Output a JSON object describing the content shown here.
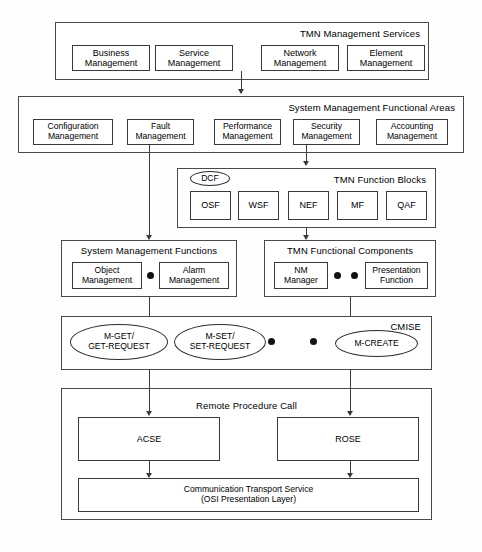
{
  "diagram": {
    "layers": [
      {
        "id": "tmn-management-services",
        "title": "TMN Management Services",
        "items": [
          {
            "label": "Business\nManagement"
          },
          {
            "label": "Service\nManagement"
          },
          {
            "label": "Network\nManagement"
          },
          {
            "label": "Element\nManagement"
          }
        ]
      },
      {
        "id": "system-management-functional-areas",
        "title": "System Management Functional Areas",
        "items": [
          {
            "label": "Configuration\nManagement"
          },
          {
            "label": "Fault\nManagement"
          },
          {
            "label": "Performance\nManagement"
          },
          {
            "label": "Security\nManagement"
          },
          {
            "label": "Accounting\nManagement"
          }
        ]
      },
      {
        "id": "tmn-function-blocks",
        "title": "TMN Function Blocks",
        "badge": "DCF",
        "items": [
          {
            "label": "OSF"
          },
          {
            "label": "WSF"
          },
          {
            "label": "NEF"
          },
          {
            "label": "MF"
          },
          {
            "label": "QAF"
          }
        ]
      },
      {
        "id": "system-management-functions",
        "title": "System Management Functions",
        "items": [
          {
            "label": "Object\nManagement"
          },
          {
            "label": "Alarm\nManagement"
          }
        ]
      },
      {
        "id": "tmn-functional-components",
        "title": "TMN Functional Components",
        "items": [
          {
            "label": "NM\nManager"
          },
          {
            "label": "Presentation\nFunction"
          }
        ]
      },
      {
        "id": "cmise",
        "title": "CMISE",
        "items": [
          {
            "label": "M-GET/\nGET-REQUEST"
          },
          {
            "label": "M-SET/\nSET-REQUEST"
          },
          {
            "label": "M-CREATE"
          }
        ]
      },
      {
        "id": "remote-procedure-call",
        "title": "Remote Procedure Call",
        "items": [
          {
            "label": "ACSE"
          },
          {
            "label": "ROSE"
          },
          {
            "label": "Communication Transport Service\n(OSI Presentation Layer)"
          }
        ]
      }
    ]
  },
  "labels": {
    "services_title": "TMN Management Services",
    "svc_business": "Business",
    "svc_business2": "Management",
    "svc_service": "Service",
    "svc_service2": "Management",
    "svc_network": "Network",
    "svc_network2": "Management",
    "svc_element": "Element",
    "svc_element2": "Management",
    "smfa_title": "System Management Functional Areas",
    "smfa_config": "Configuration",
    "smfa_config2": "Management",
    "smfa_fault": "Fault",
    "smfa_fault2": "Management",
    "smfa_perf": "Performance",
    "smfa_perf2": "Management",
    "smfa_sec": "Security",
    "smfa_sec2": "Management",
    "smfa_acct": "Accounting",
    "smfa_acct2": "Management",
    "tfb_title": "TMN Function Blocks",
    "tfb_dcf": "DCF",
    "tfb_osf": "OSF",
    "tfb_wsf": "WSF",
    "tfb_nef": "NEF",
    "tfb_mf": "MF",
    "tfb_qaf": "QAF",
    "smf_title": "System Management Functions",
    "smf_object": "Object",
    "smf_object2": "Management",
    "smf_alarm": "Alarm",
    "smf_alarm2": "Management",
    "tfc_title": "TMN Functional Components",
    "tfc_nm": "NM",
    "tfc_nm2": "Manager",
    "tfc_pres": "Presentation",
    "tfc_pres2": "Function",
    "cmise_title": "CMISE",
    "cmise_mget": "M-GET/",
    "cmise_mget2": "GET-REQUEST",
    "cmise_mset": "M-SET/",
    "cmise_mset2": "SET-REQUEST",
    "cmise_mcreate": "M-CREATE",
    "rpc_title": "Remote Procedure Call",
    "rpc_acse": "ACSE",
    "rpc_rose": "ROSE",
    "rpc_cts": "Communication Transport Service",
    "rpc_cts2": "(OSI Presentation Layer)"
  }
}
